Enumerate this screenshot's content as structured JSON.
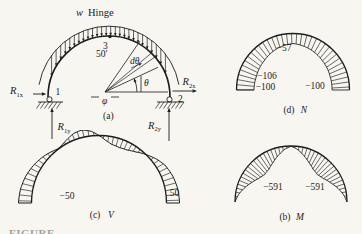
{
  "figure_caption": "FIGURE",
  "structure": {
    "panel_label": "(a)",
    "load_symbol": "w",
    "hinge_label": "Hinge",
    "node3": "3",
    "node1": "1",
    "node2": "2",
    "radius_label": "50′",
    "dtheta_label": "dθ",
    "theta_label": "θ",
    "phi_label": "φ",
    "reactions": {
      "r1x": {
        "base": "R",
        "sub": "1x"
      },
      "r1y": {
        "base": "R",
        "sub": "1y"
      },
      "r2x": {
        "base": "R",
        "sub": "2x"
      },
      "r2y": {
        "base": "R",
        "sub": "2y"
      }
    }
  },
  "normal_diagram": {
    "panel_label": "(d)",
    "symbol": "N",
    "values": {
      "crown": "−57",
      "left_mid": "−106",
      "left_base": "−100",
      "right_base": "−100"
    }
  },
  "shear_diagram": {
    "panel_label": "(c)",
    "symbol": "V",
    "values": {
      "left_base": "−50",
      "right_base": "50"
    }
  },
  "moment_diagram": {
    "panel_label": "(b)",
    "symbol": "M",
    "values": {
      "left": "−591",
      "right": "−591"
    }
  }
}
